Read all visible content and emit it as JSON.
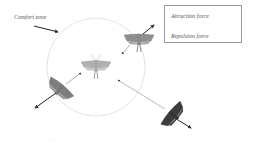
{
  "diagram": {
    "comfort_zone_label": "Comfort zone",
    "legend": {
      "items": [
        {
          "label": "Attraction force",
          "arrow_color": "#444444"
        },
        {
          "label": "Repulsion force",
          "arrow_color": "#222222"
        }
      ]
    },
    "footer_mark": ". ‘ ."
  },
  "colors": {
    "circle": "#e6e6e6",
    "moth_light": "#a9a9a9",
    "moth_mid": "#8a8a8a",
    "moth_dark": "#3a3a3a",
    "arrow": "#555555"
  }
}
